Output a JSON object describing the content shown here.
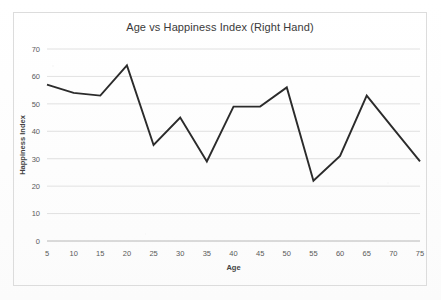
{
  "chart_data": {
    "type": "line",
    "title": "Age vs Happiness Index (Right Hand)",
    "xlabel": "Age",
    "ylabel": "Happiness Index",
    "x": [
      5,
      10,
      15,
      20,
      25,
      30,
      35,
      40,
      45,
      50,
      55,
      60,
      65,
      70,
      75
    ],
    "values": [
      57,
      54,
      53,
      64,
      35,
      45,
      29,
      49,
      49,
      56,
      22,
      31,
      53,
      41,
      29
    ],
    "series": [
      {
        "name": "Happiness Index",
        "values": [
          57,
          54,
          53,
          64,
          35,
          45,
          29,
          49,
          49,
          56,
          22,
          31,
          53,
          41,
          29
        ]
      }
    ],
    "xlim": [
      5,
      75
    ],
    "ylim": [
      0,
      70
    ],
    "xtick_labels": [
      "5",
      "10",
      "15",
      "20",
      "25",
      "30",
      "35",
      "40",
      "45",
      "50",
      "55",
      "60",
      "65",
      "70",
      "75"
    ],
    "ytick_labels": [
      "0",
      "10",
      "20",
      "30",
      "40",
      "50",
      "60",
      "70"
    ],
    "yticks": [
      0,
      10,
      20,
      30,
      40,
      50,
      60,
      70
    ],
    "grid": "horizontal",
    "legend": "none",
    "line_color": "#2b2b2b",
    "grid_color": "#d9d9d9",
    "axis_color": "#bfbfbf",
    "text_color": "#5a5a5a",
    "background_color": "#ffffff"
  }
}
